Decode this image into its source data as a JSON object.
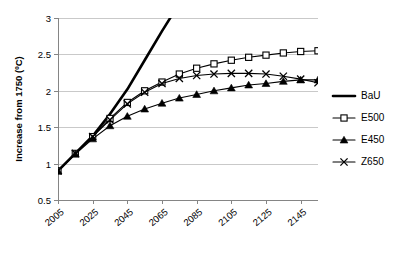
{
  "chart_data": {
    "type": "line",
    "title": "",
    "xlabel": "",
    "ylabel": "Increase from 1750 (ºC)",
    "xlim": [
      2005,
      2155
    ],
    "ylim": [
      0.5,
      3
    ],
    "grid": true,
    "legend_position": "right",
    "x_tick_labels": [
      "2005",
      "2025",
      "2045",
      "2065",
      "2085",
      "2105",
      "2125",
      "2145"
    ],
    "x_ticks": [
      2005,
      2025,
      2045,
      2065,
      2085,
      2105,
      2125,
      2145
    ],
    "y_tick_labels": [
      "0.5",
      "1",
      "1.5",
      "2",
      "2.5",
      "3"
    ],
    "y_ticks": [
      0.5,
      1,
      1.5,
      2,
      2.5,
      3
    ],
    "x": [
      2005,
      2015,
      2025,
      2035,
      2045,
      2055,
      2065,
      2075,
      2085,
      2095,
      2105,
      2115,
      2125,
      2135,
      2145,
      2155
    ],
    "series": [
      {
        "name": "BaU",
        "marker": "none",
        "style": "thick-solid",
        "values": [
          0.9,
          1.14,
          1.38,
          1.68,
          2.02,
          2.42,
          2.82,
          3.2,
          null,
          null,
          null,
          null,
          null,
          null,
          null,
          null
        ]
      },
      {
        "name": "E500",
        "marker": "open-square",
        "style": "thin-solid",
        "values": [
          0.9,
          1.14,
          1.37,
          1.62,
          1.84,
          2.0,
          2.12,
          2.23,
          2.31,
          2.37,
          2.42,
          2.46,
          2.49,
          2.52,
          2.54,
          2.55
        ]
      },
      {
        "name": "E450",
        "marker": "filled-triangle",
        "style": "thin-solid",
        "values": [
          0.9,
          1.13,
          1.34,
          1.52,
          1.65,
          1.75,
          1.83,
          1.9,
          1.95,
          2.0,
          2.04,
          2.08,
          2.1,
          2.13,
          2.15,
          2.15
        ]
      },
      {
        "name": "Z650",
        "marker": "cross-x",
        "style": "thin-solid",
        "values": [
          0.9,
          1.14,
          1.37,
          1.6,
          1.82,
          1.98,
          2.1,
          2.17,
          2.21,
          2.23,
          2.24,
          2.24,
          2.23,
          2.2,
          2.16,
          2.11
        ]
      }
    ],
    "legend_entries": [
      {
        "label": "BaU",
        "marker": "none"
      },
      {
        "label": "E500",
        "marker": "open-square"
      },
      {
        "label": "E450",
        "marker": "filled-triangle"
      },
      {
        "label": "Z650",
        "marker": "cross-x"
      }
    ],
    "colors": {
      "series": "#000000",
      "grid": "#c9c9c9",
      "axis": "#858585",
      "background": "#ffffff"
    }
  }
}
